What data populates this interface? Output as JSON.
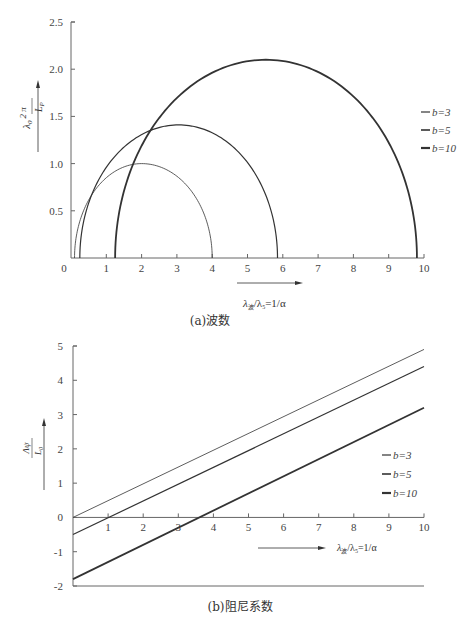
{
  "chart_data": [
    {
      "type": "line",
      "title": "",
      "caption": "(a)波数",
      "xlabel": "λ波/λ5 = 1/α",
      "ylabel": "λ0·2π/Lp",
      "xlim": [
        0,
        10
      ],
      "ylim": [
        0,
        2.5
      ],
      "xticks": [
        "0",
        "1",
        "2",
        "3",
        "4",
        "5",
        "6",
        "7",
        "8",
        "9",
        "10"
      ],
      "yticks": [
        "0.5",
        "1.0",
        "1.5",
        "2.0",
        "2.5"
      ],
      "grid": false,
      "legend_position": "right",
      "series": [
        {
          "name": "b=3",
          "shape": "semi-ellipse",
          "x_start": 0.1,
          "x_end": 4.0,
          "peak_x": 2.0,
          "peak_y": 1.0,
          "stroke_width": 0.8
        },
        {
          "name": "b=5",
          "shape": "semi-ellipse",
          "x_start": 0.25,
          "x_end": 5.85,
          "peak_x": 3.05,
          "peak_y": 1.41,
          "stroke_width": 1.2
        },
        {
          "name": "b=10",
          "shape": "semi-ellipse",
          "x_start": 1.25,
          "x_end": 9.8,
          "peak_x": 5.52,
          "peak_y": 2.1,
          "stroke_width": 1.8
        }
      ]
    },
    {
      "type": "line",
      "title": "",
      "caption": "(b)阻尼系数",
      "xlabel": "λ波/λ5 = 1/α",
      "ylabel": "Λψ/L0",
      "xlim": [
        0,
        10
      ],
      "ylim": [
        -2,
        5
      ],
      "xticks": [
        "1",
        "2",
        "3",
        "4",
        "5",
        "6",
        "7",
        "8",
        "9",
        "10"
      ],
      "yticks": [
        "-2",
        "-1",
        "0",
        "1",
        "2",
        "3",
        "4",
        "5"
      ],
      "grid": false,
      "legend_position": "right",
      "series": [
        {
          "name": "b=3",
          "x": [
            0,
            10
          ],
          "y": [
            0.0,
            4.9
          ],
          "stroke_width": 0.8
        },
        {
          "name": "b=5",
          "x": [
            0,
            10
          ],
          "y": [
            -0.5,
            4.4
          ],
          "stroke_width": 1.2
        },
        {
          "name": "b=10",
          "x": [
            0,
            10
          ],
          "y": [
            -1.8,
            3.2
          ],
          "stroke_width": 1.8
        }
      ]
    }
  ],
  "charts": {
    "a": {
      "caption": "(a)波数",
      "legend": [
        "b=3",
        "b=5",
        "b=10"
      ],
      "xlabel_main": "λ",
      "xlabel_sub1": "波",
      "xlabel_rest": "/λ",
      "xlabel_sub2": "5",
      "xlabel_tail": "=1/α",
      "ylabel_lambda": "λ",
      "ylabel_sub": "0",
      "ylabel_num": "2 π",
      "ylabel_den": "L",
      "ylabel_den_sub": "P"
    },
    "b": {
      "caption": "(b)阻尼系数",
      "legend": [
        "b=3",
        "b=5",
        "b=10"
      ],
      "xlabel_main": "λ",
      "xlabel_sub1": "波",
      "xlabel_rest": "/λ",
      "xlabel_sub2": "5",
      "xlabel_tail": "=1/α",
      "ylabel_num": "Λψ",
      "ylabel_den": "L",
      "ylabel_den_sub": "0"
    }
  }
}
